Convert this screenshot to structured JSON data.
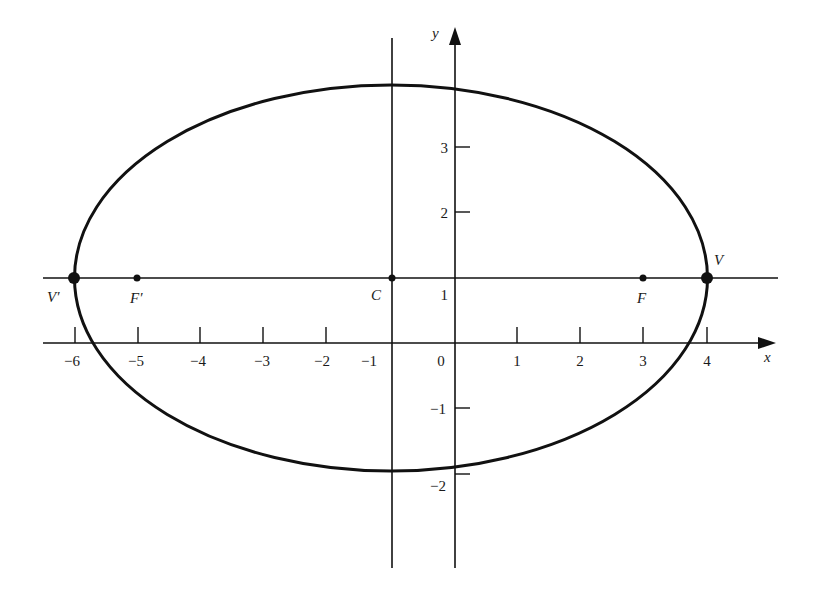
{
  "diagram": {
    "type": "ellipse-on-coordinate-plane",
    "colors": {
      "ink": "#111111",
      "background": "#ffffff"
    },
    "axes": {
      "x_label": "x",
      "y_label": "y",
      "x_ticks": [
        {
          "value": -6,
          "label": "−6"
        },
        {
          "value": -5,
          "label": "−5"
        },
        {
          "value": -4,
          "label": "−4"
        },
        {
          "value": -3,
          "label": "−3"
        },
        {
          "value": -2,
          "label": "−2"
        },
        {
          "value": -1,
          "label": "−1"
        },
        {
          "value": 0,
          "label": "0"
        },
        {
          "value": 1,
          "label": "1"
        },
        {
          "value": 2,
          "label": "2"
        },
        {
          "value": 3,
          "label": "3"
        },
        {
          "value": 4,
          "label": "4"
        }
      ],
      "y_ticks": [
        {
          "value": 3,
          "label": "3"
        },
        {
          "value": 2,
          "label": "2"
        },
        {
          "value": 1,
          "label": "1"
        },
        {
          "value": -1,
          "label": "−1"
        },
        {
          "value": -2,
          "label": "−2"
        }
      ]
    },
    "ellipse": {
      "center": [
        -1,
        1
      ],
      "semi_major_axis": 5,
      "semi_minor_axis": 2.9
    },
    "auxiliary_lines": {
      "horizontal": "y = 1",
      "vertical": "x = −1"
    },
    "points": [
      {
        "name": "V'",
        "label": "V′",
        "coords": [
          -6,
          1
        ],
        "kind": "vertex"
      },
      {
        "name": "F'",
        "label": "F′",
        "coords": [
          -5,
          1
        ],
        "kind": "focus"
      },
      {
        "name": "C",
        "label": "C",
        "coords": [
          -1,
          1
        ],
        "kind": "center"
      },
      {
        "name": "F",
        "label": "F",
        "coords": [
          3,
          1
        ],
        "kind": "focus"
      },
      {
        "name": "V",
        "label": "V",
        "coords": [
          4,
          1
        ],
        "kind": "vertex"
      }
    ]
  }
}
